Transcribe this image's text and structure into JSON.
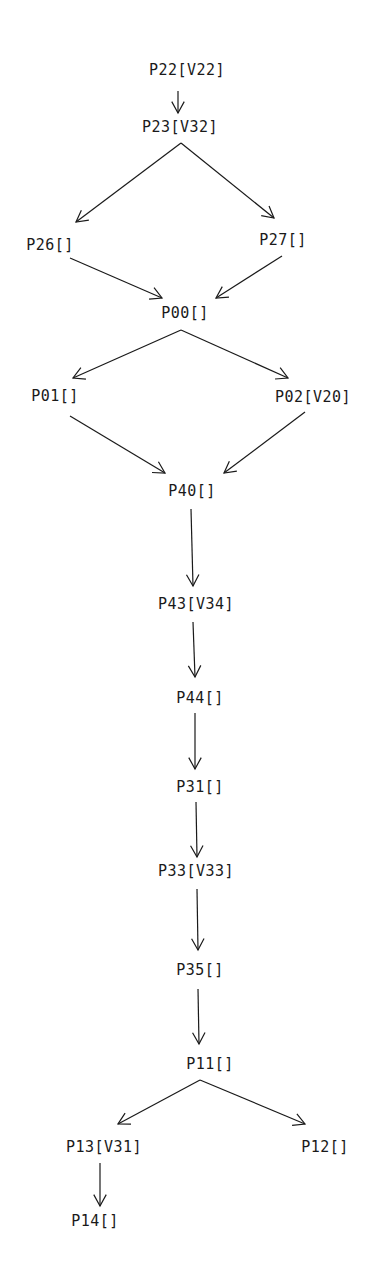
{
  "diagram": {
    "type": "directed-graph",
    "nodes": [
      {
        "id": "P22",
        "label": "P22[V22]",
        "x": 187,
        "y": 70
      },
      {
        "id": "P23",
        "label": "P23[V32]",
        "x": 180,
        "y": 127
      },
      {
        "id": "P26",
        "label": "P26[]",
        "x": 50,
        "y": 245
      },
      {
        "id": "P27",
        "label": "P27[]",
        "x": 283,
        "y": 240
      },
      {
        "id": "P00",
        "label": "P00[]",
        "x": 185,
        "y": 313
      },
      {
        "id": "P01",
        "label": "P01[]",
        "x": 55,
        "y": 396
      },
      {
        "id": "P02",
        "label": "P02[V20]",
        "x": 313,
        "y": 397
      },
      {
        "id": "P40",
        "label": "P40[]",
        "x": 192,
        "y": 491
      },
      {
        "id": "P43",
        "label": "P43[V34]",
        "x": 196,
        "y": 604
      },
      {
        "id": "P44",
        "label": "P44[]",
        "x": 200,
        "y": 698
      },
      {
        "id": "P31",
        "label": "P31[]",
        "x": 200,
        "y": 787
      },
      {
        "id": "P33",
        "label": "P33[V33]",
        "x": 196,
        "y": 871
      },
      {
        "id": "P35",
        "label": "P35[]",
        "x": 200,
        "y": 970
      },
      {
        "id": "P11",
        "label": "P11[]",
        "x": 210,
        "y": 1064
      },
      {
        "id": "P13",
        "label": "P13[V31]",
        "x": 104,
        "y": 1147
      },
      {
        "id": "P12",
        "label": "P12[]",
        "x": 325,
        "y": 1147
      },
      {
        "id": "P14",
        "label": "P14[]",
        "x": 95,
        "y": 1221
      }
    ],
    "edges": [
      {
        "from": "P22",
        "to": "P23",
        "x1": 178,
        "y1": 91,
        "x2": 178,
        "y2": 113
      },
      {
        "from": "P23",
        "to": "P26",
        "x1": 181,
        "y1": 143,
        "x2": 76,
        "y2": 222
      },
      {
        "from": "P23",
        "to": "P27",
        "x1": 181,
        "y1": 143,
        "x2": 274,
        "y2": 218
      },
      {
        "from": "P26",
        "to": "P00",
        "x1": 70,
        "y1": 258,
        "x2": 162,
        "y2": 298
      },
      {
        "from": "P27",
        "to": "P00",
        "x1": 282,
        "y1": 256,
        "x2": 216,
        "y2": 298
      },
      {
        "from": "P00",
        "to": "P01",
        "x1": 181,
        "y1": 330,
        "x2": 73,
        "y2": 378
      },
      {
        "from": "P00",
        "to": "P02",
        "x1": 181,
        "y1": 330,
        "x2": 288,
        "y2": 378
      },
      {
        "from": "P01",
        "to": "P40",
        "x1": 70,
        "y1": 416,
        "x2": 165,
        "y2": 473
      },
      {
        "from": "P02",
        "to": "P40",
        "x1": 305,
        "y1": 412,
        "x2": 224,
        "y2": 473
      },
      {
        "from": "P40",
        "to": "P43",
        "x1": 191,
        "y1": 509,
        "x2": 193,
        "y2": 586
      },
      {
        "from": "P43",
        "to": "P44",
        "x1": 193,
        "y1": 622,
        "x2": 195,
        "y2": 677
      },
      {
        "from": "P44",
        "to": "P31",
        "x1": 195,
        "y1": 713,
        "x2": 195,
        "y2": 769
      },
      {
        "from": "P31",
        "to": "P33",
        "x1": 196,
        "y1": 802,
        "x2": 197,
        "y2": 857
      },
      {
        "from": "P33",
        "to": "P35",
        "x1": 197,
        "y1": 889,
        "x2": 198,
        "y2": 950
      },
      {
        "from": "P35",
        "to": "P11",
        "x1": 198,
        "y1": 989,
        "x2": 199,
        "y2": 1044
      },
      {
        "from": "P11",
        "to": "P13",
        "x1": 200,
        "y1": 1080,
        "x2": 118,
        "y2": 1124
      },
      {
        "from": "P11",
        "to": "P12",
        "x1": 200,
        "y1": 1080,
        "x2": 305,
        "y2": 1124
      },
      {
        "from": "P13",
        "to": "P14",
        "x1": 100,
        "y1": 1163,
        "x2": 100,
        "y2": 1206
      }
    ]
  }
}
